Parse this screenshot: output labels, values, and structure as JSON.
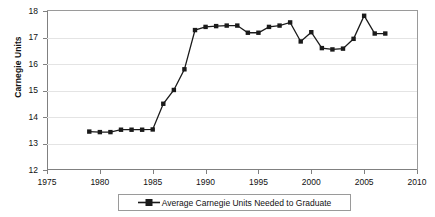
{
  "chart_data": {
    "type": "line",
    "title": "",
    "xlabel": "",
    "ylabel": "Carnegie Units",
    "xlim": [
      1975,
      2010
    ],
    "ylim": [
      12,
      18
    ],
    "xticks": [
      1975,
      1980,
      1985,
      1990,
      1995,
      2000,
      2005,
      2010
    ],
    "yticks": [
      12,
      13,
      14,
      15,
      16,
      17,
      18
    ],
    "grid": "horizontal",
    "legend_position": "bottom",
    "marker": "square",
    "series_color": "#1a1a1a",
    "series": [
      {
        "name": "Average Carnegie Units Needed to Graduate",
        "x": [
          1979,
          1980,
          1981,
          1982,
          1983,
          1984,
          1985,
          1986,
          1987,
          1988,
          1989,
          1990,
          1991,
          1992,
          1993,
          1994,
          1995,
          1996,
          1997,
          1998,
          1999,
          2000,
          2001,
          2002,
          2003,
          2004,
          2005,
          2006,
          2007
        ],
        "values": [
          13.45,
          13.43,
          13.43,
          13.52,
          13.52,
          13.52,
          13.53,
          14.5,
          15.02,
          15.8,
          17.28,
          17.4,
          17.43,
          17.45,
          17.45,
          17.18,
          17.18,
          17.4,
          17.45,
          17.57,
          16.85,
          17.2,
          16.6,
          16.55,
          16.58,
          16.95,
          17.82,
          17.15,
          17.15
        ]
      }
    ]
  },
  "legend": {
    "entry_label": "Average Carnegie Units Needed to Graduate",
    "marker_icon": "square-line-marker-icon"
  },
  "axis": {
    "y_title": "Carnegie Units",
    "y_tick_labels": [
      "12",
      "13",
      "14",
      "15",
      "16",
      "17",
      "18"
    ],
    "x_tick_labels": [
      "1975",
      "1980",
      "1985",
      "1990",
      "1995",
      "2000",
      "2005",
      "2010"
    ]
  }
}
